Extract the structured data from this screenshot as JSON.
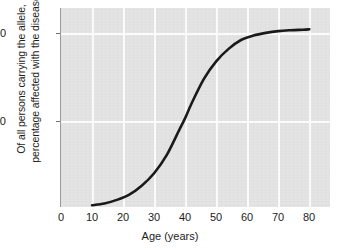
{
  "chart_data": {
    "type": "line",
    "title": "",
    "subtitle": "",
    "xlabel": "Age (years)",
    "ylabel_lines": [
      "Of all persons carrying the allele,",
      "percentage affected with the disease"
    ],
    "ylabel": "Of all persons carrying the allele, percentage affected with the disease",
    "xlim": [
      0,
      87
    ],
    "ylim": [
      0,
      112
    ],
    "xticks": [
      "0",
      "10",
      "20",
      "30",
      "40",
      "50",
      "60",
      "70",
      "80"
    ],
    "xtick_values": [
      0,
      10,
      20,
      30,
      40,
      50,
      60,
      70,
      80
    ],
    "yticks": [
      "50",
      "100"
    ],
    "ytick_values": [
      50,
      100
    ],
    "grid": true,
    "grid_color": "#fbfbfb",
    "plot_background": "#e2e2e2",
    "figure_background": "#ffffff",
    "legend": null,
    "legend_position": "none",
    "series": [
      {
        "name": "Age-related penetrance",
        "color": "#1a1a1a",
        "line_width": 2.6,
        "x": [
          10,
          14,
          18,
          22,
          26,
          30,
          34,
          38,
          40,
          42,
          46,
          50,
          54,
          58,
          62,
          66,
          70,
          74,
          78,
          80
        ],
        "y": [
          1,
          2,
          4,
          7,
          12,
          19,
          29,
          43,
          50,
          58,
          72,
          82,
          89,
          94,
          96.5,
          98,
          99,
          99.5,
          99.8,
          100
        ]
      }
    ],
    "annotations": []
  }
}
